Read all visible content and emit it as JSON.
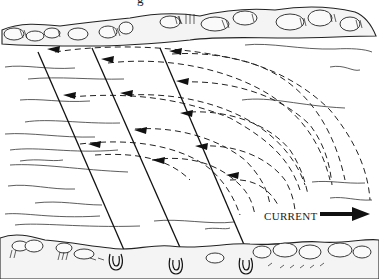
{
  "figure": {
    "caption_fragment": "g",
    "current_label": "CURRENT",
    "current_direction": "right"
  },
  "colors": {
    "ink": "#111111",
    "paper": "#ffffff"
  },
  "elements": {
    "top_bank": "rocky far riverbank with stones",
    "bottom_bank": "rocky near riverbank with stones",
    "fishing_lines_count": 3,
    "rod_holders_count": 3,
    "drift_paths_dashed": true
  }
}
